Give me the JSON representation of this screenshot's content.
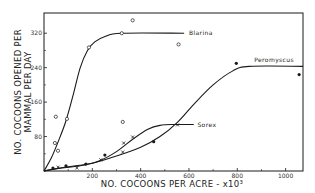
{
  "chart_data": {
    "type": "scatter",
    "title": "",
    "xlabel": "NO. COCOONS PER ACRE - x10³",
    "ylabel_line1": "NO. COCOONS OPENED PER",
    "ylabel_line2": "MAMMAL PER DAY",
    "xlim": [
      0,
      1072
    ],
    "ylim": [
      0,
      367
    ],
    "x_ticks": [
      200,
      400,
      600,
      800,
      1000
    ],
    "x_tick_labels": [
      "200",
      "400",
      "600",
      "800",
      "1000"
    ],
    "x_minor_ticks": [
      100,
      300,
      500,
      700,
      900
    ],
    "y_ticks": [
      80,
      160,
      240,
      320
    ],
    "y_tick_labels": [
      "80",
      "160",
      "240",
      "320"
    ],
    "y_minor_ticks": [
      40,
      120,
      200,
      280
    ],
    "grid": false,
    "legend": "inline labels at curve ends",
    "series": [
      {
        "name": "Blarina",
        "marker": "open-circle",
        "points": [
          [
            45,
            65
          ],
          [
            49,
            126
          ],
          [
            58,
            47
          ],
          [
            95,
            121
          ],
          [
            186,
            287
          ],
          [
            322,
            320
          ],
          [
            367,
            350
          ],
          [
            326,
            114
          ],
          [
            557,
            294
          ]
        ],
        "curve": [
          [
            0,
            0
          ],
          [
            30,
            30
          ],
          [
            60,
            70
          ],
          [
            90,
            115
          ],
          [
            120,
            175
          ],
          [
            150,
            240
          ],
          [
            180,
            280
          ],
          [
            210,
            300
          ],
          [
            250,
            312
          ],
          [
            320,
            320
          ],
          [
            580,
            320
          ]
        ],
        "label_at": [
          600,
          320
        ]
      },
      {
        "name": "Sorex",
        "marker": "x",
        "points": [
          [
            58,
            9
          ],
          [
            136,
            7
          ],
          [
            235,
            26
          ],
          [
            326,
            44
          ],
          [
            330,
            65
          ],
          [
            367,
            79
          ],
          [
            553,
            107
          ]
        ],
        "curve": [
          [
            0,
            0
          ],
          [
            60,
            6
          ],
          [
            150,
            12
          ],
          [
            230,
            24
          ],
          [
            300,
            45
          ],
          [
            370,
            75
          ],
          [
            430,
            97
          ],
          [
            480,
            106
          ],
          [
            540,
            108
          ],
          [
            620,
            108
          ]
        ],
        "label_at": [
          635,
          108
        ]
      },
      {
        "name": "Peromyscus",
        "marker": "filled-circle",
        "points": [
          [
            37,
            7
          ],
          [
            91,
            12
          ],
          [
            173,
            16
          ],
          [
            252,
            37
          ],
          [
            454,
            68
          ],
          [
            796,
            250
          ],
          [
            1056,
            224
          ]
        ],
        "curve": [
          [
            0,
            0
          ],
          [
            100,
            10
          ],
          [
            200,
            18
          ],
          [
            300,
            35
          ],
          [
            400,
            55
          ],
          [
            480,
            80
          ],
          [
            550,
            112
          ],
          [
            620,
            155
          ],
          [
            700,
            200
          ],
          [
            780,
            232
          ],
          [
            850,
            243
          ],
          [
            1072,
            243
          ]
        ],
        "label_at": [
          870,
          243
        ]
      }
    ]
  },
  "colors": {
    "ink": "#1a1a1a",
    "background": "#ffffff"
  }
}
